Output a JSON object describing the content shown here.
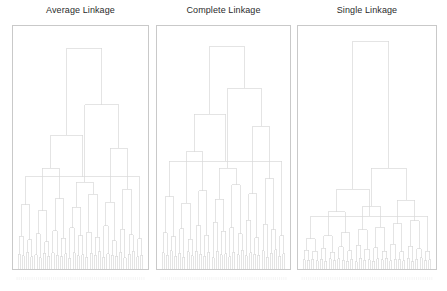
{
  "figure": {
    "background_color": "#ffffff",
    "line_color": "#d8d8d8",
    "axes_border_color": "#c9c9c9",
    "title_color": "#2b2b2b",
    "leaf_label_color": "#efefef",
    "width": 447,
    "height": 291
  },
  "panels": [
    {
      "id": "average-linkage",
      "title": "Average Linkage",
      "x": 12,
      "width": 137,
      "axes_height": 245
    },
    {
      "id": "complete-linkage",
      "title": "Complete Linkage",
      "x": 156,
      "width": 135,
      "axes_height": 245
    },
    {
      "id": "single-linkage",
      "title": "Single Linkage",
      "x": 297,
      "width": 140,
      "axes_height": 245
    }
  ],
  "chart_data": [
    {
      "type": "dendrogram",
      "title": "Average Linkage",
      "linkage_method": "average",
      "orientation": "top",
      "n_leaves": 60,
      "xlabel": "",
      "ylabel": "",
      "ylim": [
        0,
        1
      ],
      "grid": false,
      "legend": null,
      "leaf_labels": [
        "",
        "",
        "",
        "",
        "",
        "",
        "",
        "",
        "",
        "",
        "",
        "",
        "",
        "",
        "",
        "",
        "",
        "",
        "",
        "",
        "",
        "",
        "",
        "",
        "",
        "",
        "",
        "",
        "",
        "",
        "",
        "",
        "",
        "",
        "",
        "",
        "",
        "",
        "",
        "",
        "",
        "",
        "",
        "",
        "",
        "",
        "",
        "",
        "",
        "",
        "",
        "",
        "",
        "",
        "",
        "",
        "",
        "",
        "",
        ""
      ],
      "leaf_order": [
        0,
        1,
        2,
        3,
        4,
        5,
        6,
        7,
        8,
        9,
        10,
        11,
        12,
        13,
        14,
        15,
        16,
        17,
        18,
        19,
        20,
        21,
        22,
        23,
        24,
        25,
        26,
        27,
        28,
        29,
        30,
        31,
        32,
        33,
        34,
        35,
        36,
        37,
        38,
        39,
        40,
        41,
        42,
        43,
        44,
        45,
        46,
        47,
        48,
        49,
        50,
        51,
        52,
        53,
        54,
        55,
        56,
        57,
        58,
        59
      ],
      "merges": [
        [
          0,
          1,
          0.055
        ],
        [
          2,
          3,
          0.048
        ],
        [
          4,
          5,
          0.062
        ],
        [
          6,
          7,
          0.044
        ],
        [
          8,
          9,
          0.052
        ],
        [
          10,
          11,
          0.04
        ],
        [
          12,
          13,
          0.058
        ],
        [
          14,
          15,
          0.046
        ],
        [
          16,
          17,
          0.06
        ],
        [
          18,
          19,
          0.05
        ],
        [
          20,
          21,
          0.043
        ],
        [
          22,
          23,
          0.056
        ],
        [
          24,
          25,
          0.038
        ],
        [
          26,
          27,
          0.061
        ],
        [
          28,
          29,
          0.047
        ],
        [
          30,
          31,
          0.053
        ],
        [
          32,
          33,
          0.041
        ],
        [
          34,
          35,
          0.059
        ],
        [
          36,
          37,
          0.049
        ],
        [
          38,
          39,
          0.064
        ],
        [
          40,
          41,
          0.042
        ],
        [
          42,
          43,
          0.057
        ],
        [
          44,
          45,
          0.051
        ],
        [
          46,
          47,
          0.045
        ],
        [
          48,
          49,
          0.063
        ],
        [
          50,
          51,
          0.039
        ],
        [
          52,
          53,
          0.054
        ],
        [
          54,
          55,
          0.066
        ],
        [
          56,
          57,
          0.043
        ],
        [
          58,
          59,
          0.05
        ],
        [
          60,
          61,
          0.13
        ],
        [
          62,
          63,
          0.115
        ],
        [
          64,
          65,
          0.142
        ],
        [
          66,
          67,
          0.108
        ],
        [
          68,
          69,
          0.155
        ],
        [
          70,
          71,
          0.122
        ],
        [
          72,
          73,
          0.168
        ],
        [
          74,
          75,
          0.134
        ],
        [
          76,
          77,
          0.148
        ],
        [
          78,
          79,
          0.126
        ],
        [
          80,
          81,
          0.175
        ],
        [
          82,
          83,
          0.112
        ],
        [
          84,
          85,
          0.16
        ],
        [
          86,
          87,
          0.138
        ],
        [
          88,
          89,
          0.12
        ],
        [
          90,
          91,
          0.265
        ],
        [
          92,
          93,
          0.24
        ],
        [
          94,
          95,
          0.29
        ],
        [
          96,
          97,
          0.255
        ],
        [
          98,
          99,
          0.31
        ],
        [
          100,
          101,
          0.275
        ],
        [
          102,
          103,
          0.33
        ],
        [
          104,
          105,
          0.385
        ],
        [
          106,
          107,
          0.42
        ],
        [
          108,
          109,
          0.36
        ],
        [
          110,
          111,
          0.505
        ],
        [
          112,
          113,
          0.56
        ],
        [
          114,
          115,
          0.69
        ],
        [
          116,
          117,
          0.93
        ]
      ]
    },
    {
      "type": "dendrogram",
      "title": "Complete Linkage",
      "linkage_method": "complete",
      "orientation": "top",
      "n_leaves": 60,
      "xlabel": "",
      "ylabel": "",
      "ylim": [
        0,
        1
      ],
      "grid": false,
      "legend": null,
      "leaf_labels": [
        "",
        "",
        "",
        "",
        "",
        "",
        "",
        "",
        "",
        "",
        "",
        "",
        "",
        "",
        "",
        "",
        "",
        "",
        "",
        "",
        "",
        "",
        "",
        "",
        "",
        "",
        "",
        "",
        "",
        "",
        "",
        "",
        "",
        "",
        "",
        "",
        "",
        "",
        "",
        "",
        "",
        "",
        "",
        "",
        "",
        "",
        "",
        "",
        "",
        "",
        "",
        "",
        "",
        "",
        "",
        "",
        "",
        "",
        "",
        ""
      ],
      "leaf_order": [
        0,
        1,
        2,
        3,
        4,
        5,
        6,
        7,
        8,
        9,
        10,
        11,
        12,
        13,
        14,
        15,
        16,
        17,
        18,
        19,
        20,
        21,
        22,
        23,
        24,
        25,
        26,
        27,
        28,
        29,
        30,
        31,
        32,
        33,
        34,
        35,
        36,
        37,
        38,
        39,
        40,
        41,
        42,
        43,
        44,
        45,
        46,
        47,
        48,
        49,
        50,
        51,
        52,
        53,
        54,
        55,
        56,
        57,
        58,
        59
      ],
      "merges": [
        [
          0,
          1,
          0.06
        ],
        [
          2,
          3,
          0.05
        ],
        [
          4,
          5,
          0.07
        ],
        [
          6,
          7,
          0.046
        ],
        [
          8,
          9,
          0.058
        ],
        [
          10,
          11,
          0.042
        ],
        [
          12,
          13,
          0.065
        ],
        [
          14,
          15,
          0.048
        ],
        [
          16,
          17,
          0.068
        ],
        [
          18,
          19,
          0.054
        ],
        [
          20,
          21,
          0.045
        ],
        [
          22,
          23,
          0.062
        ],
        [
          24,
          25,
          0.04
        ],
        [
          26,
          27,
          0.066
        ],
        [
          28,
          29,
          0.052
        ],
        [
          30,
          31,
          0.057
        ],
        [
          32,
          33,
          0.044
        ],
        [
          34,
          35,
          0.063
        ],
        [
          36,
          37,
          0.053
        ],
        [
          38,
          39,
          0.071
        ],
        [
          40,
          41,
          0.047
        ],
        [
          42,
          43,
          0.061
        ],
        [
          44,
          45,
          0.055
        ],
        [
          46,
          47,
          0.049
        ],
        [
          48,
          49,
          0.069
        ],
        [
          50,
          51,
          0.041
        ],
        [
          52,
          53,
          0.059
        ],
        [
          54,
          55,
          0.073
        ],
        [
          56,
          57,
          0.046
        ],
        [
          58,
          59,
          0.056
        ],
        [
          60,
          61,
          0.145
        ],
        [
          62,
          63,
          0.128
        ],
        [
          64,
          65,
          0.162
        ],
        [
          66,
          67,
          0.118
        ],
        [
          68,
          69,
          0.175
        ],
        [
          70,
          71,
          0.136
        ],
        [
          72,
          73,
          0.19
        ],
        [
          74,
          75,
          0.152
        ],
        [
          76,
          77,
          0.168
        ],
        [
          78,
          79,
          0.142
        ],
        [
          80,
          81,
          0.2
        ],
        [
          82,
          83,
          0.124
        ],
        [
          84,
          85,
          0.182
        ],
        [
          86,
          87,
          0.158
        ],
        [
          88,
          89,
          0.134
        ],
        [
          90,
          91,
          0.3
        ],
        [
          92,
          93,
          0.272
        ],
        [
          94,
          95,
          0.325
        ],
        [
          96,
          97,
          0.288
        ],
        [
          98,
          99,
          0.35
        ],
        [
          100,
          101,
          0.312
        ],
        [
          102,
          103,
          0.375
        ],
        [
          104,
          105,
          0.45
        ],
        [
          106,
          107,
          0.49
        ],
        [
          108,
          109,
          0.42
        ],
        [
          110,
          111,
          0.6
        ],
        [
          112,
          113,
          0.65
        ],
        [
          114,
          115,
          0.76
        ],
        [
          116,
          117,
          0.94
        ]
      ]
    },
    {
      "type": "dendrogram",
      "title": "Single Linkage",
      "linkage_method": "single",
      "orientation": "top",
      "n_leaves": 60,
      "xlabel": "",
      "ylabel": "",
      "ylim": [
        0,
        1
      ],
      "grid": false,
      "legend": null,
      "chaining": true,
      "leaf_labels": [
        "",
        "",
        "",
        "",
        "",
        "",
        "",
        "",
        "",
        "",
        "",
        "",
        "",
        "",
        "",
        "",
        "",
        "",
        "",
        "",
        "",
        "",
        "",
        "",
        "",
        "",
        "",
        "",
        "",
        "",
        "",
        "",
        "",
        "",
        "",
        "",
        "",
        "",
        "",
        "",
        "",
        "",
        "",
        "",
        "",
        "",
        "",
        "",
        "",
        "",
        "",
        "",
        "",
        "",
        "",
        "",
        "",
        "",
        "",
        ""
      ],
      "leaf_order": [
        0,
        1,
        2,
        3,
        4,
        5,
        6,
        7,
        8,
        9,
        10,
        11,
        12,
        13,
        14,
        15,
        16,
        17,
        18,
        19,
        20,
        21,
        22,
        23,
        24,
        25,
        26,
        27,
        28,
        29,
        30,
        31,
        32,
        33,
        34,
        35,
        36,
        37,
        38,
        39,
        40,
        41,
        42,
        43,
        44,
        45,
        46,
        47,
        48,
        49,
        50,
        51,
        52,
        53,
        54,
        55,
        56,
        57,
        58,
        59
      ],
      "merges": [
        [
          0,
          1,
          0.03
        ],
        [
          2,
          3,
          0.028
        ],
        [
          4,
          5,
          0.034
        ],
        [
          6,
          7,
          0.026
        ],
        [
          8,
          9,
          0.032
        ],
        [
          10,
          11,
          0.024
        ],
        [
          12,
          13,
          0.036
        ],
        [
          14,
          15,
          0.027
        ],
        [
          16,
          17,
          0.035
        ],
        [
          18,
          19,
          0.029
        ],
        [
          20,
          21,
          0.025
        ],
        [
          22,
          23,
          0.033
        ],
        [
          24,
          25,
          0.023
        ],
        [
          26,
          27,
          0.037
        ],
        [
          28,
          29,
          0.028
        ],
        [
          30,
          31,
          0.031
        ],
        [
          32,
          33,
          0.024
        ],
        [
          34,
          35,
          0.036
        ],
        [
          36,
          37,
          0.03
        ],
        [
          38,
          39,
          0.038
        ],
        [
          40,
          41,
          0.026
        ],
        [
          42,
          43,
          0.034
        ],
        [
          44,
          45,
          0.031
        ],
        [
          46,
          47,
          0.027
        ],
        [
          48,
          49,
          0.037
        ],
        [
          50,
          51,
          0.023
        ],
        [
          52,
          53,
          0.032
        ],
        [
          54,
          55,
          0.039
        ],
        [
          56,
          57,
          0.026
        ],
        [
          58,
          59,
          0.03
        ],
        [
          60,
          61,
          0.072
        ],
        [
          62,
          63,
          0.066
        ],
        [
          64,
          65,
          0.08
        ],
        [
          66,
          67,
          0.062
        ],
        [
          68,
          69,
          0.086
        ],
        [
          70,
          71,
          0.07
        ],
        [
          72,
          73,
          0.092
        ],
        [
          74,
          75,
          0.076
        ],
        [
          76,
          77,
          0.083
        ],
        [
          78,
          79,
          0.068
        ],
        [
          80,
          81,
          0.096
        ],
        [
          82,
          83,
          0.064
        ],
        [
          84,
          85,
          0.089
        ],
        [
          86,
          87,
          0.078
        ],
        [
          88,
          89,
          0.067
        ],
        [
          90,
          91,
          0.12
        ],
        [
          92,
          93,
          0.132
        ],
        [
          94,
          95,
          0.145
        ],
        [
          96,
          97,
          0.158
        ],
        [
          98,
          99,
          0.17
        ],
        [
          100,
          101,
          0.183
        ],
        [
          102,
          103,
          0.196
        ],
        [
          104,
          105,
          0.215
        ],
        [
          106,
          107,
          0.235
        ],
        [
          108,
          109,
          0.258
        ],
        [
          110,
          111,
          0.285
        ],
        [
          112,
          113,
          0.33
        ],
        [
          114,
          115,
          0.42
        ],
        [
          116,
          117,
          0.96
        ]
      ]
    }
  ]
}
